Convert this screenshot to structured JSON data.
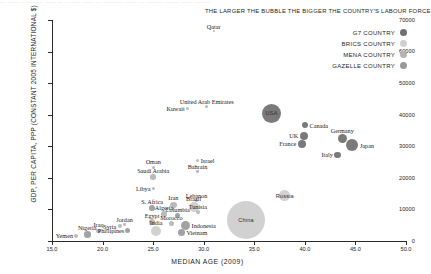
{
  "top_strip": {
    "line": "— ——  — ———  —— —  ———  ——  — ———— ——  — ———  ———  —— ———"
  },
  "legend": {
    "note": "THE LARGER THE BUBBLE THE BIGGER THE COUNTRY'S LABOUR FORCE",
    "items": [
      {
        "label": "G7 COUNTRY",
        "color": "#6f6f6f"
      },
      {
        "label": "BRICS COUNTRY",
        "color": "#cfcfcf"
      },
      {
        "label": "MENA COUNTRY",
        "color": "#b4b4b4"
      },
      {
        "label": "GAZELLE COUNTRY",
        "color": "#9a9a9a"
      }
    ]
  },
  "chart_data": {
    "type": "scatter",
    "title": "",
    "xlabel": "MEDIAN AGE (2009)",
    "ylabel": "GDP, PER CAPITA, PPP (CONSTANT 2005 INTERNATIONAL $)",
    "xlim": [
      15.0,
      50.0
    ],
    "ylim": [
      0,
      70000
    ],
    "xticks": [
      "15.0",
      "20.0",
      "25.0",
      "30.0",
      "35.0",
      "40.0",
      "45.0",
      "50.0"
    ],
    "xtick_values": [
      15.0,
      20.0,
      25.0,
      30.0,
      35.0,
      40.0,
      45.0,
      50.0
    ],
    "yticks": [
      "0",
      "10000",
      "20000",
      "30000",
      "40000",
      "50000",
      "60000",
      "70000"
    ],
    "ytick_values": [
      0,
      10000,
      20000,
      30000,
      40000,
      50000,
      60000,
      70000
    ],
    "grid": false,
    "legend_position": "top-right",
    "size_meaning": "bubble area ~ country's labour force",
    "points": [
      {
        "name": "Qatar",
        "x": 31.0,
        "y": 66500,
        "r": 1.2,
        "group": "MENA",
        "label_pos": "above",
        "label_inside": false
      },
      {
        "name": "Kuwait",
        "x": 28.4,
        "y": 42000,
        "r": 1.6,
        "group": "MENA",
        "label_pos": "left",
        "label_inside": false
      },
      {
        "name": "United Arab Emirates",
        "x": 30.3,
        "y": 42500,
        "r": 1.5,
        "group": "MENA",
        "label_pos": "above",
        "label_inside": false
      },
      {
        "name": "USA",
        "x": 36.7,
        "y": 40500,
        "r": 9.5,
        "group": "G7",
        "label_pos": "inside",
        "label_inside": true
      },
      {
        "name": "Canada",
        "x": 40.0,
        "y": 36700,
        "r": 3.2,
        "group": "G7",
        "label_pos": "right",
        "label_inside": false
      },
      {
        "name": "UK",
        "x": 39.9,
        "y": 33300,
        "r": 4.0,
        "group": "G7",
        "label_pos": "left",
        "label_inside": false
      },
      {
        "name": "Germany",
        "x": 43.7,
        "y": 32400,
        "r": 4.6,
        "group": "G7",
        "label_pos": "above",
        "label_inside": false
      },
      {
        "name": "France",
        "x": 39.7,
        "y": 30800,
        "r": 4.0,
        "group": "G7",
        "label_pos": "left",
        "label_inside": false
      },
      {
        "name": "Japan",
        "x": 44.7,
        "y": 30300,
        "r": 6.0,
        "group": "G7",
        "label_pos": "right",
        "label_inside": false
      },
      {
        "name": "Italy",
        "x": 43.2,
        "y": 27300,
        "r": 3.3,
        "group": "G7",
        "label_pos": "left",
        "label_inside": false
      },
      {
        "name": "Israel",
        "x": 29.4,
        "y": 25400,
        "r": 1.6,
        "group": "MENA",
        "label_pos": "right",
        "label_inside": false
      },
      {
        "name": "Oman",
        "x": 25.0,
        "y": 23400,
        "r": 1.6,
        "group": "MENA",
        "label_pos": "above",
        "label_inside": false
      },
      {
        "name": "Bahrain",
        "x": 29.4,
        "y": 22000,
        "r": 1.3,
        "group": "MENA",
        "label_pos": "above",
        "label_inside": false
      },
      {
        "name": "Saudi Arabia",
        "x": 25.0,
        "y": 20200,
        "r": 2.8,
        "group": "MENA",
        "label_pos": "above",
        "label_inside": false
      },
      {
        "name": "Libya",
        "x": 25.0,
        "y": 16500,
        "r": 1.6,
        "group": "MENA",
        "label_pos": "left",
        "label_inside": false
      },
      {
        "name": "Russia",
        "x": 38.0,
        "y": 14300,
        "r": 5.6,
        "group": "BRICS",
        "label_pos": "inside",
        "label_inside": true
      },
      {
        "name": "Lebanon",
        "x": 29.3,
        "y": 12900,
        "r": 1.3,
        "group": "MENA",
        "label_pos": "above",
        "label_inside": false
      },
      {
        "name": "Iran",
        "x": 27.0,
        "y": 11400,
        "r": 3.4,
        "group": "MENA",
        "label_pos": "above",
        "label_inside": false
      },
      {
        "name": "Brazil",
        "x": 29.0,
        "y": 10800,
        "r": 5.0,
        "group": "BRICS",
        "label_pos": "above",
        "label_inside": false
      },
      {
        "name": "S. Africa",
        "x": 24.9,
        "y": 10300,
        "r": 3.0,
        "group": "GAZELLE",
        "label_pos": "above",
        "label_inside": false
      },
      {
        "name": "Tunisia",
        "x": 29.4,
        "y": 9200,
        "r": 1.9,
        "group": "MENA",
        "label_pos": "above",
        "label_inside": false
      },
      {
        "name": "Algeria",
        "x": 26.1,
        "y": 8600,
        "r": 2.8,
        "group": "MENA",
        "label_pos": "above",
        "label_inside": false
      },
      {
        "name": "Columbia",
        "x": 27.4,
        "y": 8100,
        "r": 2.7,
        "group": "GAZELLE",
        "label_pos": "above",
        "label_inside": false
      },
      {
        "name": "China",
        "x": 34.2,
        "y": 6600,
        "r": 19.0,
        "group": "BRICS",
        "label_pos": "inside",
        "label_inside": true
      },
      {
        "name": "Egypt",
        "x": 24.9,
        "y": 6000,
        "r": 3.2,
        "group": "MENA",
        "label_pos": "above",
        "label_inside": false
      },
      {
        "name": "Morocco",
        "x": 26.8,
        "y": 5500,
        "r": 2.8,
        "group": "MENA",
        "label_pos": "above",
        "label_inside": false
      },
      {
        "name": "Indonesia",
        "x": 28.2,
        "y": 5000,
        "r": 4.6,
        "group": "GAZELLE",
        "label_pos": "right",
        "label_inside": false
      },
      {
        "name": "Jordan",
        "x": 22.2,
        "y": 5300,
        "r": 1.4,
        "group": "MENA",
        "label_pos": "above",
        "label_inside": false
      },
      {
        "name": "Syria",
        "x": 21.7,
        "y": 4700,
        "r": 2.0,
        "group": "MENA",
        "label_pos": "left",
        "label_inside": false
      },
      {
        "name": "India",
        "x": 25.3,
        "y": 3100,
        "r": 5.0,
        "group": "BRICS",
        "label_pos": "above",
        "label_inside": false
      },
      {
        "name": "Phillipines",
        "x": 22.5,
        "y": 3200,
        "r": 2.6,
        "group": "GAZELLE",
        "label_pos": "left",
        "label_inside": false
      },
      {
        "name": "Vietnam",
        "x": 27.8,
        "y": 2800,
        "r": 3.5,
        "group": "GAZELLE",
        "label_pos": "right",
        "label_inside": false
      },
      {
        "name": "Iraq",
        "x": 19.6,
        "y": 3200,
        "r": 2.2,
        "group": "MENA",
        "label_pos": "above",
        "label_inside": false
      },
      {
        "name": "Nigeria",
        "x": 18.5,
        "y": 2000,
        "r": 3.2,
        "group": "GAZELLE",
        "label_pos": "above",
        "label_inside": false
      },
      {
        "name": "Yemen",
        "x": 17.4,
        "y": 1600,
        "r": 2.0,
        "group": "MENA",
        "label_pos": "left",
        "label_inside": false
      }
    ]
  },
  "group_colors": {
    "G7": "#6f6f6f",
    "BRICS": "#cfcfcf",
    "MENA": "#b4b4b4",
    "GAZELLE": "#9a9a9a"
  }
}
